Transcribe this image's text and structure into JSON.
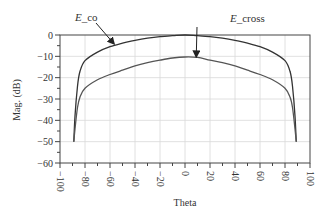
{
  "chart_data": {
    "type": "line",
    "title": "",
    "xlabel": "Theta",
    "ylabel": "Mag. (dB)",
    "xlim": [
      -100,
      100
    ],
    "ylim": [
      -60,
      0
    ],
    "grid": true,
    "legend": "none (inline annotations)",
    "x_ticks": [
      -100,
      -80,
      -60,
      -40,
      -20,
      0,
      20,
      40,
      60,
      80,
      100
    ],
    "x_tick_labels": [
      "-100",
      "-80",
      "-60",
      "-40",
      "-20",
      "0",
      "20",
      "40",
      "60",
      "80",
      "100"
    ],
    "y_ticks": [
      0,
      -10,
      -20,
      -30,
      -40,
      -50,
      -60
    ],
    "y_tick_labels": [
      "0",
      "-10",
      "-20",
      "-30",
      "-40",
      "-50",
      "-60"
    ],
    "x": [
      -89,
      -88,
      -86,
      -84,
      -80,
      -70,
      -60,
      -50,
      -40,
      -30,
      -20,
      -10,
      0,
      10,
      20,
      30,
      40,
      50,
      60,
      70,
      80,
      84,
      86,
      88,
      89
    ],
    "series": [
      {
        "name": "E_co",
        "values": [
          -50,
          -38,
          -24,
          -17,
          -12,
          -8,
          -5.5,
          -3.8,
          -2.5,
          -1.5,
          -0.8,
          -0.3,
          0,
          -0.3,
          -0.8,
          -1.5,
          -2.5,
          -3.8,
          -5.5,
          -8,
          -12,
          -17,
          -24,
          -38,
          -50
        ]
      },
      {
        "name": "E_cross",
        "values": [
          -50,
          -44,
          -34,
          -29,
          -25,
          -21,
          -18.5,
          -16.5,
          -14.5,
          -13,
          -11.8,
          -10.8,
          -10.3,
          -10.5,
          -11.8,
          -13,
          -14.5,
          -16.5,
          -18.5,
          -21,
          -25,
          -29,
          -34,
          -44,
          -50
        ]
      }
    ],
    "annotations": [
      {
        "text": "E_co",
        "points_to": {
          "theta": -57,
          "dB": -4.5
        }
      },
      {
        "text": "E_cross",
        "points_to": {
          "theta": 9,
          "dB": -10.5
        }
      }
    ]
  }
}
